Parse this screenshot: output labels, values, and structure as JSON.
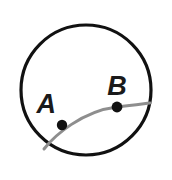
{
  "figure": {
    "type": "geometry-diagram",
    "background_color": "#ffffff",
    "canvas": {
      "width": 172,
      "height": 180
    },
    "circle": {
      "name": "outer-circle",
      "center_x": 86,
      "center_y": 90,
      "radius": 65,
      "stroke_color": "#111111",
      "stroke_width": 3.2,
      "fill": "none"
    },
    "arc": {
      "name": "chord-arc",
      "stroke_color": "#8e8e8e",
      "stroke_width": 3.0,
      "start_x": 44,
      "start_y": 149,
      "control1_x": 60,
      "control1_y": 130,
      "control2_x": 95,
      "control2_y": 108,
      "end_x": 150,
      "end_y": 103,
      "path": "M 44 149 C 54 136 82 111 117 107 C 132 105.4 142 104 150 103"
    },
    "points": [
      {
        "id": "A",
        "label": "A",
        "dot_x": 62,
        "dot_y": 125,
        "dot_radius": 5.2,
        "dot_color": "#111111",
        "label_x": 56,
        "label_y": 113,
        "label_anchor": "end"
      },
      {
        "id": "B",
        "label": "B",
        "dot_x": 117,
        "dot_y": 107,
        "dot_radius": 5.4,
        "dot_color": "#111111",
        "label_x": 117,
        "label_y": 95,
        "label_anchor": "middle"
      }
    ]
  }
}
